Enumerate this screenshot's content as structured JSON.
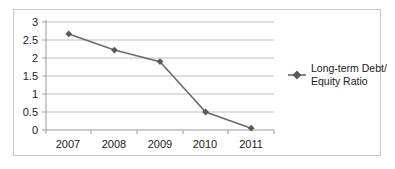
{
  "chart_data": {
    "type": "line",
    "title": "",
    "xlabel": "",
    "ylabel": "",
    "categories": [
      "2007",
      "2008",
      "2009",
      "2010",
      "2011"
    ],
    "series": [
      {
        "name": "Long-term Debt/ Equity Ratio",
        "values": [
          2.67,
          2.22,
          1.9,
          0.5,
          0.05
        ]
      }
    ],
    "ylim": [
      0,
      3
    ],
    "yticks": [
      "0",
      "0.5",
      "1",
      "1.5",
      "2",
      "2.5",
      "3"
    ],
    "ytick_values": [
      0,
      0.5,
      1,
      1.5,
      2,
      2.5,
      3
    ],
    "grid": true,
    "grid_axis": "y",
    "legend_position": "right",
    "marker": "diamond",
    "line_color": "#6b6b6b",
    "marker_color": "#5a5a5a",
    "grid_color": "#c0c0c0",
    "axis_color": "#9a9a9a",
    "border_color": "#c9c9c9",
    "text_color": "#1a1a1a"
  },
  "legend": {
    "entries": [
      {
        "marker_name": "diamond-marker",
        "line1": "Long-term Debt/",
        "line2": "Equity Ratio"
      }
    ]
  },
  "axes": {
    "x_tick_labels": [
      "2007",
      "2008",
      "2009",
      "2010",
      "2011"
    ],
    "y_tick_labels": [
      "3",
      "2.5",
      "2",
      "1.5",
      "1",
      "0.5",
      "0"
    ]
  }
}
